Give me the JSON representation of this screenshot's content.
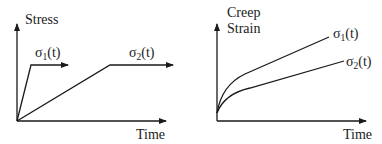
{
  "colors": {
    "ink": "#1a1a1a",
    "background": "#ffffff"
  },
  "left_panel": {
    "y_axis_label": "Stress",
    "x_axis_label": "Time",
    "curves": [
      {
        "symbol": "σ",
        "subscript": "1",
        "arg": "(t)"
      },
      {
        "symbol": "σ",
        "subscript": "2",
        "arg": "(t)"
      }
    ]
  },
  "right_panel": {
    "y_axis_label_line1": "Creep",
    "y_axis_label_line2": "Strain",
    "x_axis_label": "Time",
    "curves": [
      {
        "symbol": "σ",
        "subscript": "1",
        "arg": "(t)"
      },
      {
        "symbol": "σ",
        "subscript": "2",
        "arg": "(t)"
      }
    ]
  }
}
